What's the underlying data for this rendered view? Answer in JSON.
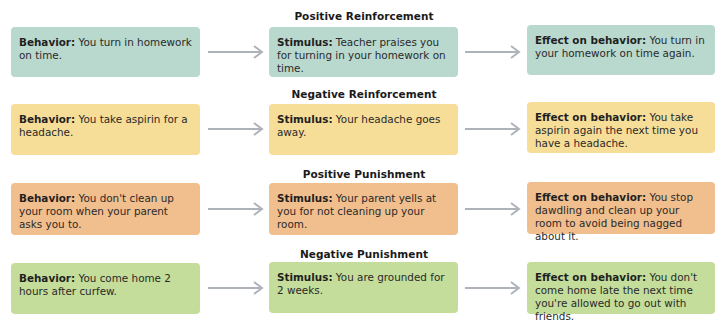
{
  "rows": [
    {
      "title": "Positive Reinforcement",
      "color": "#b9d8ce",
      "behavior_label": "Behavior:",
      "behavior_text": " You turn in homework on time.",
      "stimulus_label": "Stimulus:",
      "stimulus_text": " Teacher praises you for turning in your homework on time.",
      "effect_label": "Effect on behavior:",
      "effect_text": " You turn in your homework on time again."
    },
    {
      "title": "Negative Reinforcement",
      "color": "#f6dd98",
      "behavior_label": "Behavior:",
      "behavior_text": " You take aspirin for a headache.",
      "stimulus_label": "Stimulus:",
      "stimulus_text": " Your headache goes away.",
      "effect_label": "Effect on behavior:",
      "effect_text": " You take aspirin again the next time you have a headache."
    },
    {
      "title": "Positive Punishment",
      "color": "#f1be8e",
      "behavior_label": "Behavior:",
      "behavior_text": " You don't clean up your room when your parent asks you to.",
      "stimulus_label": "Stimulus:",
      "stimulus_text": " Your parent yells at you for not cleaning up your room.",
      "effect_label": "Effect on behavior:",
      "effect_text": " You stop dawdling and clean up your room to avoid being nagged about it."
    },
    {
      "title": "Negative Punishment",
      "color": "#c4dd9a",
      "behavior_label": "Behavior:",
      "behavior_text": " You come home 2 hours after curfew.",
      "stimulus_label": "Stimulus:",
      "stimulus_text": " You are grounded for 2 weeks.",
      "effect_label": "Effect on behavior:",
      "effect_text": " You don't come home late the next time you're allowed to go out with friends."
    }
  ],
  "arrow_color": "#aeb3ba"
}
